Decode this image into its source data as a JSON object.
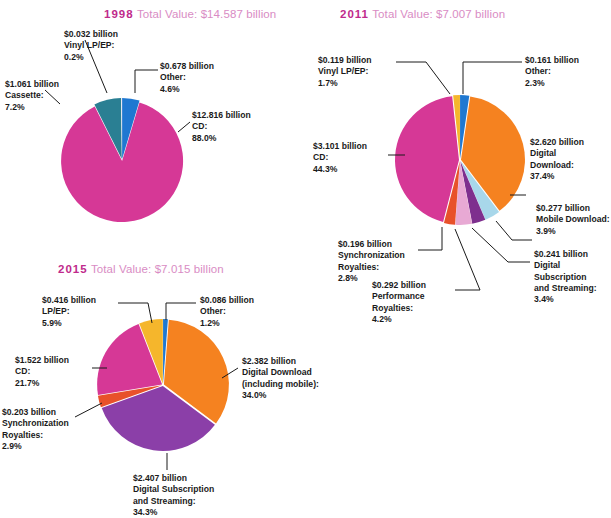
{
  "chart_data": [
    {
      "type": "pie",
      "title": "1998 Total Value: $14.587 billion",
      "year": "1998",
      "total_text": "Total Value: $14.587 billion",
      "total_value": 14.587,
      "units": "billion USD",
      "categories": [
        "CD",
        "Cassette",
        "Vinyl LP/EP",
        "Other"
      ],
      "values": [
        12.816,
        1.061,
        0.032,
        0.678
      ],
      "percents": [
        88.0,
        7.2,
        0.2,
        4.6
      ],
      "colors": [
        "#d63896",
        "#2a7f93",
        "#e8e3ee",
        "#1f78d1"
      ],
      "legend_position": "callout-labels",
      "labels": [
        {
          "value": "$12.816 billion",
          "name": "CD:",
          "percent": "88.0%"
        },
        {
          "value": "$1.061 billion",
          "name": "Cassette:",
          "percent": "7.2%"
        },
        {
          "value": "$0.032 billion",
          "name": "Vinyl LP/EP:",
          "percent": "0.2%"
        },
        {
          "value": "$0.678 billion",
          "name": "Other:",
          "percent": "4.6%"
        }
      ]
    },
    {
      "type": "pie",
      "title": "2011 Total Value: $7.007 billion",
      "year": "2011",
      "total_text": "Total Value: $7.007 billion",
      "total_value": 7.007,
      "units": "billion USD",
      "categories": [
        "Digital Download",
        "Mobile Download",
        "Digital Subscription and Streaming",
        "Performance Royalties",
        "Synchronization Royalties",
        "CD",
        "Vinyl LP/EP",
        "Other"
      ],
      "values": [
        2.62,
        0.277,
        0.241,
        0.292,
        0.196,
        3.101,
        0.119,
        0.161
      ],
      "percents": [
        37.4,
        3.9,
        3.4,
        4.2,
        2.8,
        44.3,
        1.7,
        2.3
      ],
      "colors": [
        "#f58220",
        "#a8d7ea",
        "#7e2f8e",
        "#e8a9d4",
        "#e8512a",
        "#d63896",
        "#f5b62c",
        "#1f78d1"
      ],
      "legend_position": "callout-labels",
      "labels": [
        {
          "value": "$2.620 billion",
          "name": "Digital Download:",
          "percent": "37.4%"
        },
        {
          "value": "$0.277 billion",
          "name": "Mobile Download:",
          "percent": "3.9%"
        },
        {
          "value": "$0.241 billion",
          "name": "Digital Subscription and Streaming:",
          "percent": "3.4%"
        },
        {
          "value": "$0.292 billion",
          "name": "Performance Royalties:",
          "percent": "4.2%"
        },
        {
          "value": "$0.196 billion",
          "name": "Synchronization Royalties:",
          "percent": "2.8%"
        },
        {
          "value": "$3.101 billion",
          "name": "CD:",
          "percent": "44.3%"
        },
        {
          "value": "$0.119 billion",
          "name": "Vinyl LP/EP:",
          "percent": "1.7%"
        },
        {
          "value": "$0.161 billion",
          "name": "Other:",
          "percent": "2.3%"
        }
      ]
    },
    {
      "type": "pie",
      "title": "2015 Total Value: $7.015 billion",
      "year": "2015",
      "total_text": "Total Value: $7.015 billion",
      "total_value": 7.015,
      "units": "billion USD",
      "categories": [
        "Digital Download (including mobile)",
        "Digital Subscription and Streaming",
        "Synchronization Royalties",
        "CD",
        "LP/EP",
        "Other"
      ],
      "values": [
        2.382,
        2.407,
        0.203,
        1.522,
        0.416,
        0.086
      ],
      "percents": [
        34.0,
        34.3,
        2.9,
        21.7,
        5.9,
        1.2
      ],
      "colors": [
        "#f58220",
        "#8b3fa8",
        "#e8512a",
        "#d63896",
        "#f5b62c",
        "#1f78d1"
      ],
      "legend_position": "callout-labels",
      "labels": [
        {
          "value": "$2.382 billion",
          "name": "Digital Download (including mobile):",
          "percent": "34.0%"
        },
        {
          "value": "$2.407 billion",
          "name": "Digital Subscription and Streaming:",
          "percent": "34.3%"
        },
        {
          "value": "$0.203 billion",
          "name": "Synchronization Royalties:",
          "percent": "2.9%"
        },
        {
          "value": "$1.522 billion",
          "name": "CD:",
          "percent": "21.7%"
        },
        {
          "value": "$0.416 billion",
          "name": "LP/EP:",
          "percent": "5.9%"
        },
        {
          "value": "$0.086 billion",
          "name": "Other:",
          "percent": "1.2%"
        }
      ]
    }
  ],
  "c1998": {
    "year": "1998",
    "total": "Total Value: $14.587 billion",
    "cd_v": "$12.816 billion",
    "cd_n": "CD:",
    "cd_p": "88.0%",
    "cas_v": "$1.061 billion",
    "cas_n": "Cassette:",
    "cas_p": "7.2%",
    "vin_v": "$0.032 billion",
    "vin_n": "Vinyl LP/EP:",
    "vin_p": "0.2%",
    "oth_v": "$0.678 billion",
    "oth_n": "Other:",
    "oth_p": "4.6%"
  },
  "c2011": {
    "year": "2011",
    "total": "Total Value: $7.007 billion",
    "vin_v": "$0.119 billion",
    "vin_n": "Vinyl LP/EP:",
    "vin_p": "1.7%",
    "oth_v": "$0.161 billion",
    "oth_n": "Other:",
    "oth_p": "2.3%",
    "cd_v": "$3.101 billion",
    "cd_n": "CD:",
    "cd_p": "44.3%",
    "dd_v": "$2.620 billion",
    "dd_n1": "Digital",
    "dd_n2": "Download:",
    "dd_p": "37.4%",
    "md_v": "$0.277 billion",
    "md_n": "Mobile Download:",
    "md_p": "3.9%",
    "ds_v": "$0.241 billion",
    "ds_n1": "Digital",
    "ds_n2": "Subscription",
    "ds_n3": "and Streaming:",
    "ds_p": "3.4%",
    "sy_v": "$0.196 billion",
    "sy_n1": "Synchronization",
    "sy_n2": "Royalties:",
    "sy_p": "2.8%",
    "pf_v": "$0.292 billion",
    "pf_n1": "Performance",
    "pf_n2": "Royalties:",
    "pf_p": "4.2%"
  },
  "c2015": {
    "year": "2015",
    "total": "Total Value: $7.015 billion",
    "lp_v": "$0.416 billion",
    "lp_n": "LP/EP:",
    "lp_p": "5.9%",
    "oth_v": "$0.086 billion",
    "oth_n": "Other:",
    "oth_p": "1.2%",
    "cd_v": "$1.522 billion",
    "cd_n": "CD:",
    "cd_p": "21.7%",
    "sy_v": "$0.203 billion",
    "sy_n1": "Synchronization",
    "sy_n2": "Royalties:",
    "sy_p": "2.9%",
    "dd_v": "$2.382 billion",
    "dd_n1": "Digital Download",
    "dd_n2": "(including mobile):",
    "dd_p": "34.0%",
    "ds_v": "$2.407 billion",
    "ds_n1": "Digital Subscription",
    "ds_n2": "and Streaming:",
    "ds_p": "34.3%"
  }
}
